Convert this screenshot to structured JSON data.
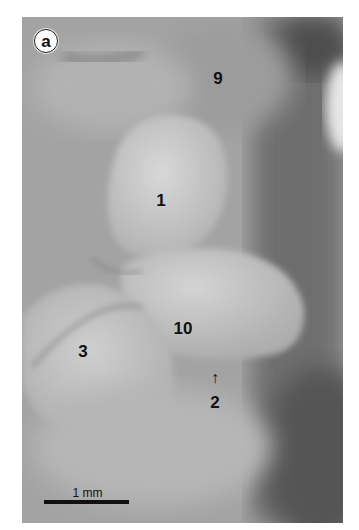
{
  "figure": {
    "panel_label": "a",
    "structure_labels": [
      {
        "id": "label-9",
        "text": "9"
      },
      {
        "id": "label-1",
        "text": "1"
      },
      {
        "id": "label-10",
        "text": "10"
      },
      {
        "id": "label-3",
        "text": "3"
      },
      {
        "id": "label-2",
        "text": "2"
      }
    ],
    "arrow_glyph": "↑",
    "scale_bar": {
      "label": "1 mm"
    }
  }
}
